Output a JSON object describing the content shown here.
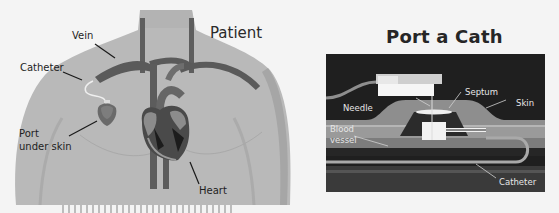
{
  "figure": {
    "left_panel": {
      "title": "Patient",
      "labels": {
        "vein": "Vein",
        "catheter": "Catheter",
        "port_line1": "Port",
        "port_line2": "under skin",
        "heart": "Heart"
      }
    },
    "right_panel": {
      "title": "Port a Cath",
      "labels": {
        "septum": "Septum",
        "skin": "Skin",
        "needle": "Needle",
        "blood_line1": "Blood",
        "blood_line2": "vessel",
        "catheter": "Catheter"
      }
    },
    "colors": {
      "background": "#f4f4f4",
      "body": "#b9b9b9",
      "body_edge": "#a3a3a3",
      "vessel": "#5c5c5c",
      "panel": "#1f1f1f",
      "skin_layer": "#8e8e8e",
      "blood_layer": "#9a9a9a",
      "port_body": "#f2f2f2"
    }
  }
}
